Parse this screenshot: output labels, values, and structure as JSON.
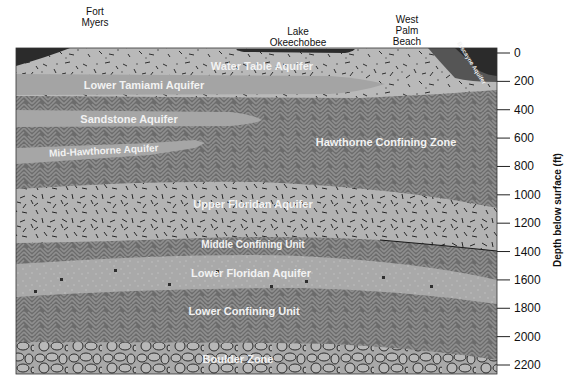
{
  "locations": [
    {
      "name": "Fort Myers",
      "lines": [
        "Fort",
        "Myers"
      ]
    },
    {
      "name": "Lake Okeechobee",
      "lines": [
        "Lake",
        "Okeechobee"
      ]
    },
    {
      "name": "West Palm Beach",
      "lines": [
        "West",
        "Palm",
        "Beach"
      ]
    }
  ],
  "axis": {
    "title": "Depth below surface (ft)",
    "ticks": [
      "0",
      "200",
      "400",
      "600",
      "800",
      "1000",
      "1200",
      "1400",
      "1600",
      "1800",
      "2000",
      "2200"
    ],
    "tick_values": [
      0,
      200,
      400,
      600,
      800,
      1000,
      1200,
      1400,
      1600,
      1800,
      2000,
      2200
    ]
  },
  "layers": {
    "water_table": "Water Table Aquifer",
    "lower_tamiami": "Lower Tamiami Aquifer",
    "sandstone": "Sandstone Aquifer",
    "mid_hawthorne": "Mid-Hawthorne Aquifer",
    "hawthorne_confining": "Hawthorne Confining Zone",
    "upper_floridan": "Upper Floridan Aquifer",
    "middle_confining": "Middle Confining Unit",
    "lower_floridan": "Lower Floridan Aquifer",
    "lower_confining": "Lower Confining Unit",
    "boulder_zone": "Boulder Zone",
    "biscayne": "Biscayne Aquifer"
  },
  "colors": {
    "confining": "#6e6e6e",
    "confining_weave": "#8c8c8c",
    "aquifer_light": "#b8b8b8",
    "aquifer_mid": "#a6a6a6",
    "surface_water": "#2b2b2b",
    "biscayne": "#555555",
    "label": "#f2f2f2"
  }
}
